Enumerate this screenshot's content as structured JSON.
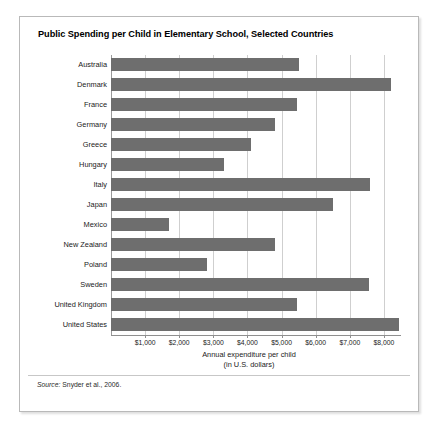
{
  "figure": {
    "title": "Public Spending per Child in Elementary School, Selected Countries",
    "source_label": "Source:",
    "source_text": " Snyder et al., 2006.",
    "bar_color": "#6e6e6e",
    "grid_color": "#cfcfcf",
    "axis_color": "#8f8f8f"
  },
  "chart_data": {
    "type": "bar",
    "orientation": "horizontal",
    "title": "Public Spending per Child in Elementary School, Selected Countries",
    "xlabel": "Annual expenditure per child",
    "xlabel_line2": "(in U.S. dollars)",
    "ylabel": "",
    "xlim": [
      0,
      8500
    ],
    "xticks": [
      1000,
      2000,
      3000,
      4000,
      5000,
      6000,
      7000,
      8000
    ],
    "xtick_labels": [
      "$1,000",
      "$2,000",
      "$3,000",
      "$4,000",
      "$5,000",
      "$6,000",
      "$7,000",
      "$8,000"
    ],
    "grid": true,
    "legend": null,
    "categories": [
      "Australia",
      "Denmark",
      "France",
      "Germany",
      "Greece",
      "Hungary",
      "Italy",
      "Japan",
      "Mexico",
      "New Zealand",
      "Poland",
      "Sweden",
      "United Kingdom",
      "United States"
    ],
    "values": [
      5500,
      8200,
      5450,
      4800,
      4100,
      3300,
      7600,
      6500,
      1700,
      4800,
      2800,
      7550,
      5450,
      8450
    ]
  }
}
